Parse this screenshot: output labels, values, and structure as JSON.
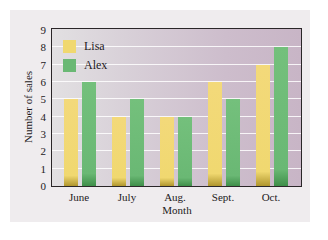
{
  "chart_data": {
    "type": "bar",
    "title": "",
    "xlabel": "Month",
    "ylabel": "Number of sales",
    "categories": [
      "June",
      "July",
      "Aug.",
      "Sept.",
      "Oct."
    ],
    "series": [
      {
        "name": "Lisa",
        "color": "#f0d870",
        "values": [
          5,
          4,
          4,
          6,
          7
        ]
      },
      {
        "name": "Alex",
        "color": "#6ab874",
        "values": [
          6,
          5,
          4,
          5,
          8
        ]
      }
    ],
    "ylim": [
      0,
      9
    ],
    "yticks": [
      0,
      1,
      2,
      3,
      4,
      5,
      6,
      7,
      8,
      9
    ],
    "grid": true,
    "legend_position": "upper left"
  }
}
